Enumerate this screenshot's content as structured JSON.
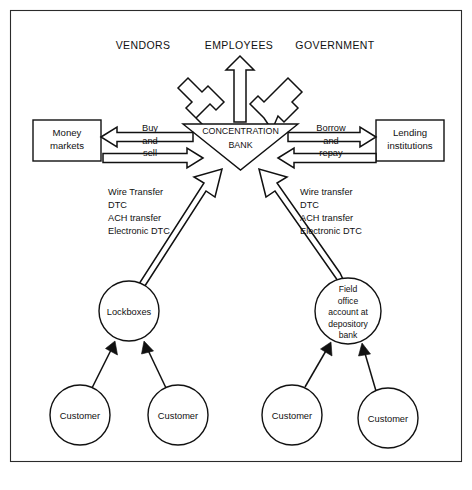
{
  "diagram": {
    "frame": {
      "present": true,
      "color": "#2b2b2b"
    },
    "outflow_targets": [
      {
        "id": "vendors",
        "label": "VENDORS"
      },
      {
        "id": "employees",
        "label": "EMPLOYEES"
      },
      {
        "id": "government",
        "label": "GOVERNMENT"
      }
    ],
    "center": {
      "id": "concentration-bank",
      "shape": "inverted-triangle",
      "line1": "CONCENTRATION",
      "line2": "BANK"
    },
    "left_box": {
      "id": "money-markets",
      "line1": "Money",
      "line2": "markets"
    },
    "right_box": {
      "id": "lending-institutions",
      "line1": "Lending",
      "line2": "institutions"
    },
    "left_flow_label": {
      "line1": "Buy",
      "line2": "and",
      "line3": "sell"
    },
    "right_flow_label": {
      "line1": "Borrow",
      "line2": "and",
      "line3": "repay"
    },
    "left_transfer_methods": [
      "Wire Transfer",
      "DTC",
      "ACH transfer",
      "Electronic DTC"
    ],
    "right_transfer_methods": [
      "Wire transfer",
      "DTC",
      "ACH transfer",
      "Electronic DTC"
    ],
    "collection_nodes": [
      {
        "id": "lockboxes",
        "lines": [
          "Lockboxes"
        ]
      },
      {
        "id": "field-office-account",
        "lines": [
          "Field",
          "office",
          "account at",
          "depository",
          "bank"
        ]
      }
    ],
    "customers": [
      {
        "id": "customer-1",
        "label": "Customer"
      },
      {
        "id": "customer-2",
        "label": "Customer"
      },
      {
        "id": "customer-3",
        "label": "Customer"
      },
      {
        "id": "customer-4",
        "label": "Customer"
      }
    ]
  }
}
